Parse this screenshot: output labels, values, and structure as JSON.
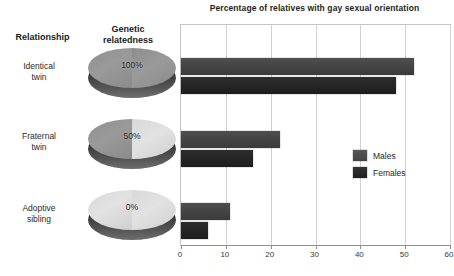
{
  "chart_data": {
    "type": "bar",
    "orientation": "horizontal",
    "title": "Percentage of relatives with gay sexual orientation",
    "xlabel": "",
    "ylabel": "",
    "categories": [
      "Identical twin",
      "Fraternal twin",
      "Adoptive sibling"
    ],
    "series": [
      {
        "name": "Males",
        "values": [
          52,
          22,
          11
        ],
        "color": "#444444"
      },
      {
        "name": "Females",
        "values": [
          48,
          16,
          6
        ],
        "color": "#242424"
      }
    ],
    "xlim": [
      0,
      60
    ],
    "xticks": [
      0,
      10,
      20,
      30,
      40,
      50,
      60
    ],
    "xtick_labels": [
      "0",
      "10",
      "20",
      "30",
      "40",
      "50",
      "60"
    ],
    "grid": true,
    "legend_position": "right-middle"
  },
  "headers": {
    "relationship": "Relationship",
    "relatedness": "Genetic\nrelatedness",
    "relatedness_line1": "Genetic",
    "relatedness_line2": "relatedness"
  },
  "rows": [
    {
      "label_line1": "Identical",
      "label_line2": "twin",
      "relatedness_percent": "100%",
      "disc_left_tone": "dark",
      "disc_right_tone": "dark"
    },
    {
      "label_line1": "Fraternal",
      "label_line2": "twin",
      "relatedness_percent": "50%",
      "disc_left_tone": "dark",
      "disc_right_tone": "light"
    },
    {
      "label_line1": "Adoptive",
      "label_line2": "sibling",
      "relatedness_percent": "0%",
      "disc_left_tone": "light",
      "disc_right_tone": "light"
    }
  ],
  "legend": {
    "items": [
      {
        "label": "Males",
        "color": "#444444"
      },
      {
        "label": "Females",
        "color": "#242424"
      }
    ]
  }
}
